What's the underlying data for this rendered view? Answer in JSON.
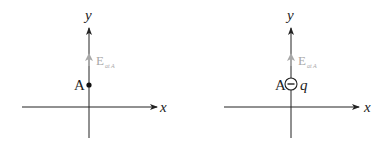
{
  "panels": [
    {
      "id": "left",
      "axes": {
        "x_label": "x",
        "y_label": "y"
      },
      "point_label": "A",
      "field": {
        "label": "E",
        "subscript": "at A"
      }
    },
    {
      "id": "right",
      "axes": {
        "x_label": "x",
        "y_label": "y"
      },
      "point_label": "A",
      "charge": {
        "sign": "−",
        "label": "q"
      },
      "field": {
        "label": "E",
        "subscript": "at A"
      }
    }
  ],
  "colors": {
    "axis": "#222222",
    "field_arrow": "#a8a8a8"
  }
}
